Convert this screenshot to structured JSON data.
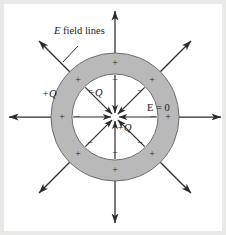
{
  "figure": {
    "background_color": "#e9e9e7",
    "canvas_color": "#ffffff",
    "shell_fill_color": "#b9b9b9",
    "stroke_color": "#2b2b2b"
  },
  "labels": {
    "field_lines": {
      "text": "E field lines",
      "italic_part": "E",
      "rest": " field lines"
    },
    "outer_charge": {
      "sign": "+",
      "symbol": "Q",
      "text": "+Q"
    },
    "inner_surface_charge": {
      "sign": "−",
      "symbol": "Q",
      "text": "−Q"
    },
    "center_charge": {
      "sign": "+",
      "symbol": "Q",
      "text": "+Q"
    },
    "field_zero": {
      "text": "E = 0"
    }
  },
  "geometry": {
    "center_x": 115,
    "center_y": 117,
    "outer_radius": 64,
    "inner_radius": 43,
    "field_line_outer_end": 108,
    "inner_arrow_start_radius": 42
  },
  "charge_signs": {
    "outer_surface": [
      "+",
      "+",
      "+",
      "+",
      "+",
      "+",
      "+",
      "+"
    ],
    "inner_surface": [
      "−",
      "−",
      "−",
      "−",
      "−",
      "−",
      "−",
      "−"
    ]
  },
  "field_lines": {
    "outward_count": 8,
    "outward_angles_deg": [
      0,
      45,
      90,
      135,
      180,
      225,
      270,
      315
    ],
    "inward_count": 8,
    "inward_angles_deg": [
      0,
      45,
      90,
      135,
      180,
      225,
      270,
      315
    ],
    "direction_outside": "outward",
    "direction_inside_cavity": "inward toward center"
  }
}
